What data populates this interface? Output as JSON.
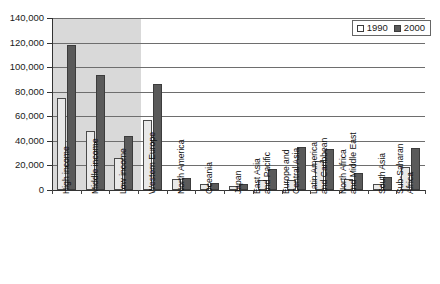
{
  "chart_data": {
    "type": "bar",
    "title": "",
    "xlabel": "",
    "ylabel": "",
    "ylim": [
      0,
      140000
    ],
    "ytick_step": 20000,
    "ytick_labels": [
      "140,000",
      "120,000",
      "100,000",
      "80,000",
      "60,000",
      "40,000",
      "20,000",
      "0"
    ],
    "ytick_values": [
      140000,
      120000,
      100000,
      80000,
      60000,
      40000,
      20000,
      0
    ],
    "grid": true,
    "legend_position": "top-right",
    "categories": [
      "High income",
      "Middle income",
      "Low income",
      "Western Europe",
      "North America",
      "Oceania",
      "Japan",
      "East Asia and Pacific",
      "Europe and Central Asia",
      "Latin America and Caribbean",
      "North Africa and Middle East",
      "South Asia",
      "Sub-Saharan Africa"
    ],
    "category_lines": [
      [
        "High income"
      ],
      [
        "Middle income"
      ],
      [
        "Low income"
      ],
      [
        "Western Europe"
      ],
      [
        "North America"
      ],
      [
        "Oceania"
      ],
      [
        "Japan"
      ],
      [
        "East Asia",
        "and Pacific"
      ],
      [
        "Europe and",
        "Central Asia"
      ],
      [
        "Latin America",
        "and Caribbean"
      ],
      [
        "North Africa",
        "and Middle East"
      ],
      [
        "South Asia"
      ],
      [
        "Sub-Saharan",
        "Africa"
      ]
    ],
    "series": [
      {
        "name": "1990",
        "color": "#e9e9e9",
        "values": [
          75000,
          48000,
          26000,
          57000,
          9000,
          5000,
          3000,
          8000,
          8000,
          24000,
          9000,
          5000,
          19000
        ]
      },
      {
        "name": "2000",
        "color": "#5a5a5a",
        "values": [
          118000,
          94000,
          44000,
          86000,
          10000,
          6000,
          4500,
          17000,
          35000,
          33000,
          14000,
          11000,
          34000
        ]
      }
    ],
    "highlight_band": {
      "label": "income groups",
      "categories": [
        "High income",
        "Middle income",
        "Low income"
      ],
      "color": "#d9d9d9"
    }
  },
  "legend": {
    "entries": [
      {
        "label": "1990"
      },
      {
        "label": "2000"
      }
    ]
  }
}
